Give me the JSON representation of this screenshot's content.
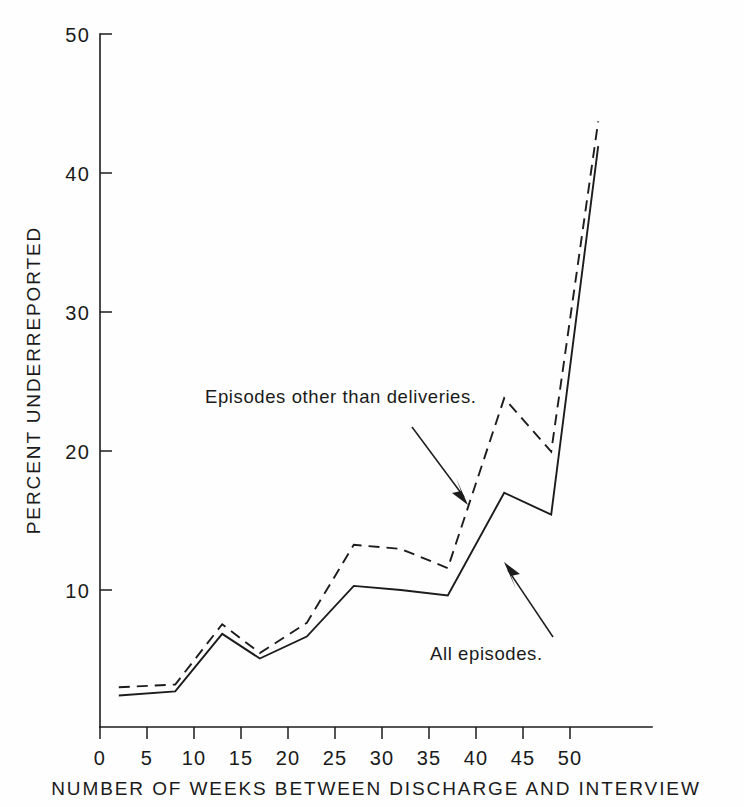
{
  "chart_data": {
    "type": "line",
    "title": "",
    "xlabel": "NUMBER OF WEEKS BETWEEN DISCHARGE AND INTERVIEW",
    "ylabel": "PERCENT UNDERREPORTED",
    "xlim": [
      0,
      55
    ],
    "ylim": [
      0,
      50
    ],
    "xticks": [
      0,
      5,
      10,
      15,
      20,
      25,
      30,
      35,
      40,
      45,
      50
    ],
    "xticklabels": [
      "0",
      "5",
      "10",
      "15",
      "20",
      "25",
      "30",
      "35",
      "40",
      "45",
      "50"
    ],
    "yticks": [
      10,
      20,
      30,
      40,
      50
    ],
    "yticklabels": [
      "10",
      "20",
      "30",
      "40",
      "50"
    ],
    "grid": false,
    "legend_position": "inline-annotations",
    "x": [
      2,
      8,
      13,
      17,
      22,
      27,
      32,
      37,
      43,
      48,
      53
    ],
    "series": [
      {
        "name": "Episodes other than deliveries.",
        "style": "dashed",
        "values": [
          2.9,
          3.1,
          7.5,
          5.4,
          7.6,
          13.3,
          13.0,
          11.6,
          24.0,
          20.1,
          44.2
        ]
      },
      {
        "name": "All episodes.",
        "style": "solid",
        "values": [
          2.3,
          2.6,
          6.8,
          5.0,
          6.6,
          10.3,
          10.0,
          9.6,
          17.1,
          15.5,
          42.4
        ]
      }
    ],
    "annotations": [
      {
        "id": "annotation-dashed",
        "text": "Episodes other than deliveries.",
        "target_series": "Episodes other than deliveries.",
        "arrow": "points-down-right"
      },
      {
        "id": "annotation-solid",
        "text": "All episodes.",
        "target_series": "All episodes.",
        "arrow": "points-up-left"
      }
    ],
    "colors": {
      "ink": "#1c1c1c",
      "background": "#fefefe"
    }
  }
}
